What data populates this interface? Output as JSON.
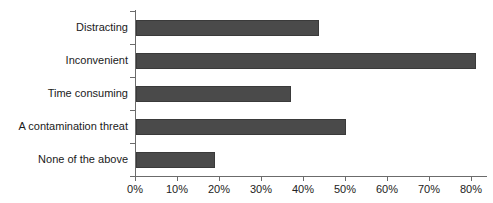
{
  "chart_data": {
    "type": "bar",
    "orientation": "horizontal",
    "title": "",
    "xlabel": "",
    "ylabel": "",
    "categories": [
      "Distracting",
      "Inconvenient",
      "Time consuming",
      "A contamination threat",
      "None of the above"
    ],
    "values": [
      43.5,
      81,
      37,
      50,
      18.8
    ],
    "value_suffix": "%",
    "xlim": [
      0,
      84
    ],
    "xticks": [
      0,
      10,
      20,
      30,
      40,
      50,
      60,
      70,
      80
    ],
    "xtick_labels": [
      "0%",
      "10%",
      "20%",
      "30%",
      "40%",
      "50%",
      "60%",
      "70%",
      "80%"
    ],
    "grid": false,
    "legend": false,
    "series": [
      {
        "name": "Percent of respondents",
        "values": [
          43.5,
          81,
          37,
          50,
          18.8
        ]
      }
    ]
  },
  "style": {
    "bar_fill": "#4a4a4a",
    "bar_border": "#3a3a3a",
    "axis_color": "#6b6b6b",
    "text_color": "#1a1a1a",
    "background": "#ffffff"
  }
}
